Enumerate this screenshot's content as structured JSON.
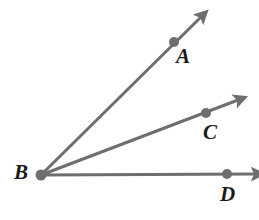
{
  "figure": {
    "type": "geometry-diagram",
    "width": 259,
    "height": 220,
    "background_color": "#ffffff",
    "stroke_color": "#6e6e6e",
    "point_color": "#6e6e6e",
    "label_color": "#1a1a1a",
    "stroke_width": 3
  },
  "vertex": {
    "label": "B",
    "point": {
      "x": 41,
      "y": 175
    },
    "label_position": {
      "x": 14,
      "y": 162
    },
    "dot_radius": 5.5
  },
  "rays": [
    {
      "name": "ray-ba",
      "label": "A",
      "from": {
        "x": 41,
        "y": 175
      },
      "point": {
        "x": 174,
        "y": 42
      },
      "tip": {
        "x": 201,
        "y": 17
      },
      "label_position": {
        "x": 176,
        "y": 46
      },
      "dot_radius": 5,
      "angle_degrees": 45
    },
    {
      "name": "ray-bc",
      "label": "C",
      "from": {
        "x": 41,
        "y": 175
      },
      "point": {
        "x": 206,
        "y": 113
      },
      "tip": {
        "x": 238,
        "y": 100
      },
      "label_position": {
        "x": 203,
        "y": 122
      },
      "dot_radius": 5,
      "angle_degrees": 21
    },
    {
      "name": "ray-bd",
      "label": "D",
      "from": {
        "x": 41,
        "y": 175
      },
      "point": {
        "x": 227,
        "y": 174
      },
      "tip": {
        "x": 255,
        "y": 174
      },
      "label_position": {
        "x": 220,
        "y": 184
      },
      "dot_radius": 5,
      "angle_degrees": 0
    }
  ],
  "chart_data": {
    "type": "scatter",
    "title": "",
    "xlabel": "",
    "ylabel": "",
    "annotations": [
      "A",
      "B",
      "C",
      "D"
    ],
    "points": [
      {
        "label": "B",
        "x": 41,
        "y": 175,
        "role": "vertex"
      },
      {
        "label": "A",
        "x": 174,
        "y": 42,
        "role": "ray-point"
      },
      {
        "label": "C",
        "x": 206,
        "y": 113,
        "role": "ray-point"
      },
      {
        "label": "D",
        "x": 227,
        "y": 174,
        "role": "ray-point"
      }
    ],
    "series": [
      {
        "name": "ray BA",
        "values": [
          41,
          175,
          201,
          17
        ]
      },
      {
        "name": "ray BC",
        "values": [
          41,
          175,
          238,
          100
        ]
      },
      {
        "name": "ray BD",
        "values": [
          41,
          175,
          255,
          174
        ]
      }
    ]
  }
}
